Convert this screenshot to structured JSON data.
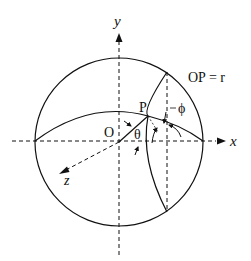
{
  "diagram": {
    "labels": {
      "y_axis": "y",
      "x_axis": "x",
      "z_axis": "z",
      "origin": "O",
      "point": "P",
      "theta": "θ",
      "phi": "ϕ",
      "radius_eq": "OP = r"
    },
    "colors": {
      "stroke": "#111111",
      "background": "#ffffff"
    }
  }
}
